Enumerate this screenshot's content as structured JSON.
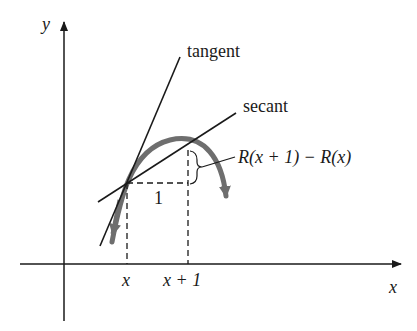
{
  "axes": {
    "y_label": "y",
    "x_label": "x"
  },
  "labels": {
    "tangent": "tangent",
    "secant": "secant",
    "difference": "R(x + 1) − R(x)",
    "run": "1",
    "tick_x": "x",
    "tick_x_plus_1": "x + 1"
  },
  "colors": {
    "line": "#1a1a1a",
    "curve": "#6e6e6e"
  }
}
